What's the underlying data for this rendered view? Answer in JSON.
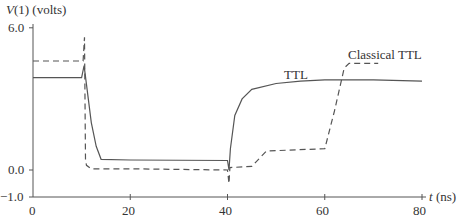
{
  "chart_data": {
    "type": "line",
    "title": "",
    "ylabel": "V(1) (volts)",
    "xlabel": "t (ns)",
    "xlim": [
      0,
      80
    ],
    "ylim": [
      -1.0,
      6.0
    ],
    "x_ticks": [
      "0",
      "20",
      "40",
      "60",
      "80"
    ],
    "y_ticks": [
      "6.0",
      "0.0",
      "-1.0"
    ],
    "grid": false,
    "legend": "inline labels",
    "series": [
      {
        "name": "TTL",
        "style": "solid",
        "points": [
          [
            0,
            3.9
          ],
          [
            10,
            3.9
          ],
          [
            10.5,
            4.4
          ],
          [
            11,
            3.6
          ],
          [
            12,
            2.0
          ],
          [
            13,
            1.0
          ],
          [
            14,
            0.45
          ],
          [
            20,
            0.42
          ],
          [
            40,
            0.4
          ],
          [
            40.3,
            0.0
          ],
          [
            40.6,
            0.9
          ],
          [
            41.5,
            2.3
          ],
          [
            43,
            3.0
          ],
          [
            45,
            3.4
          ],
          [
            50,
            3.65
          ],
          [
            55,
            3.75
          ],
          [
            60,
            3.8
          ],
          [
            70,
            3.8
          ],
          [
            80,
            3.75
          ]
        ]
      },
      {
        "name": "Classical TTL",
        "style": "dashed",
        "points": [
          [
            0,
            4.6
          ],
          [
            10.3,
            4.6
          ],
          [
            10.6,
            5.6
          ],
          [
            10.8,
            0.4
          ],
          [
            11,
            0.2
          ],
          [
            12,
            0.05
          ],
          [
            20,
            0.05
          ],
          [
            40,
            0.0
          ],
          [
            40.3,
            -0.5
          ],
          [
            40.5,
            0.1
          ],
          [
            45,
            0.15
          ],
          [
            48,
            0.8
          ],
          [
            60,
            0.9
          ],
          [
            62,
            2.5
          ],
          [
            64,
            4.3
          ],
          [
            65,
            4.5
          ],
          [
            71,
            4.5
          ]
        ]
      }
    ],
    "annotations": [
      {
        "text": "TTL",
        "x": 52,
        "y": 4.2
      },
      {
        "text": "Classical TTL",
        "x": 68,
        "y": 4.9
      }
    ]
  },
  "labels": {
    "ylabel_italic": "V",
    "ylabel_rest": "(1) (volts)",
    "xlabel_italic": "t",
    "xlabel_rest": " (ns)",
    "ttl": "TTL",
    "classical": "Classical TTL",
    "y6": "6.0",
    "y0": "0.0",
    "ym1": "−1.0",
    "x0": "0",
    "x20": "20",
    "x40": "40",
    "x60": "60",
    "x80": "80"
  }
}
